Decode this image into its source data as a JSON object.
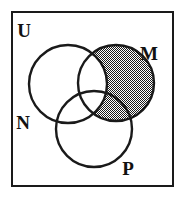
{
  "diagram": {
    "type": "venn-three-set",
    "universe": {
      "label": "U",
      "label_position": {
        "x": 24,
        "y": 37
      },
      "frame": {
        "x": 12,
        "y": 12,
        "width": 161,
        "height": 174
      },
      "stroke_color": "#1a1a1a",
      "stroke_width": 2,
      "fill_color": "#ffffff"
    },
    "sets": [
      {
        "id": "N",
        "label": "N",
        "label_position": {
          "x": 23,
          "y": 129
        },
        "circle": {
          "cx": 68,
          "cy": 84,
          "r": 39
        },
        "shaded": false
      },
      {
        "id": "M",
        "label": "M",
        "label_position": {
          "x": 149,
          "y": 60
        },
        "circle": {
          "cx": 116,
          "cy": 83,
          "r": 38
        },
        "shaded": true
      },
      {
        "id": "P",
        "label": "P",
        "label_position": {
          "x": 128,
          "y": 175
        },
        "circle": {
          "cx": 94,
          "cy": 129,
          "r": 38
        },
        "shaded": false
      }
    ],
    "shading": {
      "description": "M minus N (the part of M outside N, including M intersect P outside N) is filled with a fine checkerboard hatch",
      "region_expression": "M \\ N",
      "pattern": "checkerboard-hatch",
      "pattern_color": "#1a1a1a",
      "pattern_background": "#ffffff",
      "pattern_cell_px": 1
    },
    "stroke_color": "#1a1a1a",
    "stroke_width": 2.4,
    "background_color": "#ffffff"
  }
}
